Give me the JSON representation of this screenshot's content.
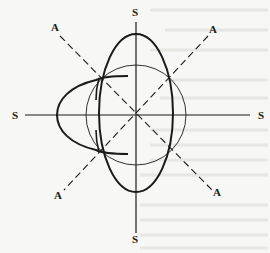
{
  "diagram": {
    "type": "polar-pattern",
    "labels": {
      "axis_top": "S",
      "axis_bottom": "S",
      "axis_left": "S",
      "axis_right": "S",
      "diag_top_left": "A",
      "diag_top_right": "A",
      "diag_bottom_left": "A",
      "diag_bottom_right": "A"
    },
    "elements": [
      {
        "name": "vertical-axis",
        "style": "solid"
      },
      {
        "name": "horizontal-axis",
        "style": "solid"
      },
      {
        "name": "diagonal-axis-1",
        "style": "dashed"
      },
      {
        "name": "diagonal-axis-2",
        "style": "dashed"
      },
      {
        "name": "reference-circle",
        "style": "thin"
      },
      {
        "name": "vertical-ellipse-lobe",
        "style": "bold"
      },
      {
        "name": "left-parabolic-lobe",
        "style": "bold"
      }
    ],
    "colors": {
      "line": "#1a1a1a",
      "background": "#f7f7f5",
      "bleed_through": "#d8d8d4"
    }
  }
}
